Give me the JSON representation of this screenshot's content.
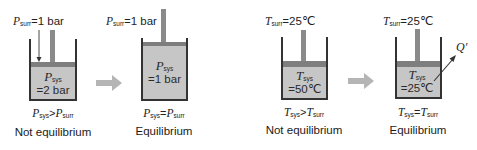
{
  "colors": {
    "wall": "#333333",
    "piston": "#7e7e7e",
    "gas_fill": "#c6c6c6",
    "process_arrow": "#b5b5b5",
    "text": "#222222"
  },
  "panels": [
    {
      "id": "pressure-initial",
      "surr_label": {
        "symbol": "P",
        "sub": "surr",
        "rel": "=",
        "value": "1 bar"
      },
      "sys_label": {
        "symbol": "P",
        "sub": "sys",
        "value": "=2 bar"
      },
      "relation": {
        "left_symbol": "P",
        "left_sub": "sys",
        "op": ">",
        "right_symbol": "P",
        "right_sub": "surr"
      },
      "caption": "Not equilibrium"
    },
    {
      "id": "pressure-final",
      "surr_label": {
        "symbol": "P",
        "sub": "surr",
        "rel": "=",
        "value": "1 bar"
      },
      "sys_label": {
        "symbol": "P",
        "sub": "sys",
        "value": "=1 bar"
      },
      "relation": {
        "left_symbol": "P",
        "left_sub": "sys",
        "op": "=",
        "right_symbol": "P",
        "right_sub": "surr"
      },
      "caption": "Equilibrium"
    },
    {
      "id": "temperature-initial",
      "surr_label": {
        "symbol": "T",
        "sub": "surr",
        "rel": "=",
        "value": "25℃"
      },
      "sys_label": {
        "symbol": "T",
        "sub": "sys",
        "value": "=50℃"
      },
      "relation": {
        "left_symbol": "T",
        "left_sub": "sys",
        "op": ">",
        "right_symbol": "T",
        "right_sub": "surr"
      },
      "caption": "Not equilibrium"
    },
    {
      "id": "temperature-final",
      "surr_label": {
        "symbol": "T",
        "sub": "surr",
        "rel": "=",
        "value": "25℃"
      },
      "sys_label": {
        "symbol": "T",
        "sub": "sys",
        "value": "=25℃"
      },
      "relation": {
        "left_symbol": "T",
        "left_sub": "sys",
        "op": "=",
        "right_symbol": "T",
        "right_sub": "surr"
      },
      "caption": "Equilibrium",
      "heat_label": "Q′"
    }
  ],
  "icons": {
    "process_arrow": "right-arrow-icon",
    "pressure_arrow": "down-arrow-icon",
    "heat_arrow": "heat-flow-arrow-icon"
  }
}
